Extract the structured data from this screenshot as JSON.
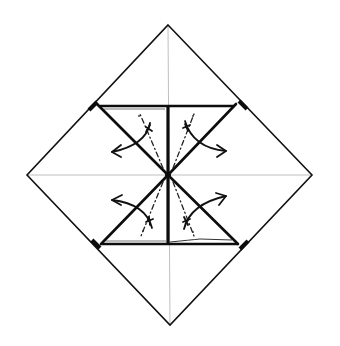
{
  "diagram": {
    "type": "origami-instruction",
    "colors": {
      "line": "#111111",
      "crease": "#b8b8b8",
      "background": "#ffffff"
    },
    "paper": {
      "shape": "diamond",
      "vertices": {
        "top": [
          168,
          25
        ],
        "right": [
          312,
          175
        ],
        "bottom": [
          170,
          325
        ],
        "left": [
          27,
          175
        ]
      }
    },
    "center": [
      168,
      175
    ],
    "creases": [
      {
        "name": "horizontal-crease",
        "from": [
          27,
          175
        ],
        "to": [
          312,
          175
        ]
      },
      {
        "name": "vertical-crease",
        "from": [
          168,
          25
        ],
        "to": [
          170,
          325
        ]
      }
    ],
    "flaps": [
      {
        "name": "upper-left-flap",
        "corner": [
          97,
          106
        ],
        "arrow_direction": "out-left"
      },
      {
        "name": "upper-right-flap",
        "corner": [
          238,
          106
        ],
        "arrow_direction": "out-right"
      },
      {
        "name": "lower-left-flap",
        "corner": [
          100,
          244
        ],
        "arrow_direction": "out-left"
      },
      {
        "name": "lower-right-flap",
        "corner": [
          240,
          244
        ],
        "arrow_direction": "out-right"
      }
    ],
    "fold_lines": {
      "upper_band_y": 106,
      "lower_band_y": 244,
      "center_line": {
        "from": [
          168,
          106
        ],
        "to": [
          168,
          244
        ]
      }
    },
    "arrows": [
      {
        "name": "arrow-upper-left",
        "label": "unfold"
      },
      {
        "name": "arrow-upper-right",
        "label": "unfold"
      },
      {
        "name": "arrow-lower-left",
        "label": "unfold"
      },
      {
        "name": "arrow-lower-right",
        "label": "unfold"
      }
    ],
    "text": []
  }
}
